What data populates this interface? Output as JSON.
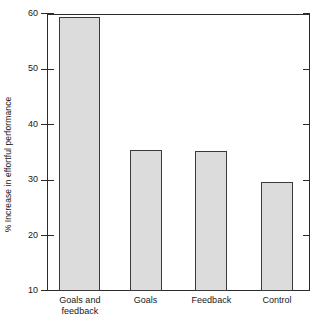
{
  "chart_data": {
    "type": "bar",
    "title": "",
    "subtitle": "",
    "xlabel": "",
    "ylabel": "% Increase in effortful performance",
    "categories": [
      "Goals and feedback",
      "Goals",
      "Feedback",
      "Control"
    ],
    "category_lines": [
      [
        "Goals and",
        "feedback"
      ],
      [
        "Goals"
      ],
      [
        "Feedback"
      ],
      [
        "Control"
      ]
    ],
    "values": [
      59.5,
      35.5,
      35.3,
      29.7
    ],
    "ylim": [
      10,
      60
    ],
    "yticks": [
      10,
      20,
      30,
      40,
      50,
      60
    ],
    "ytick_labels": [
      "10",
      "20",
      "30",
      "40",
      "50",
      "60"
    ],
    "grid": false,
    "legend": null,
    "legend_position": "none",
    "bar_fill_color": "#dcdcdc",
    "bar_edge_color": "#3a3a3a",
    "axis_color": "#2b2b2b",
    "background_color": "#ffffff",
    "annotations": []
  }
}
